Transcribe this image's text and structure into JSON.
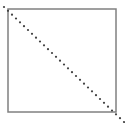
{
  "diagram": {
    "square": {
      "x": 8,
      "y": 9,
      "width": 108,
      "height": 103,
      "stroke": "#808080",
      "stroke_width": 1.5
    },
    "diagonal": {
      "x1": 4,
      "y1": 7,
      "x2": 124,
      "y2": 122,
      "stroke": "#404040",
      "dot_radius": 1.1,
      "dot_count": 30
    }
  }
}
